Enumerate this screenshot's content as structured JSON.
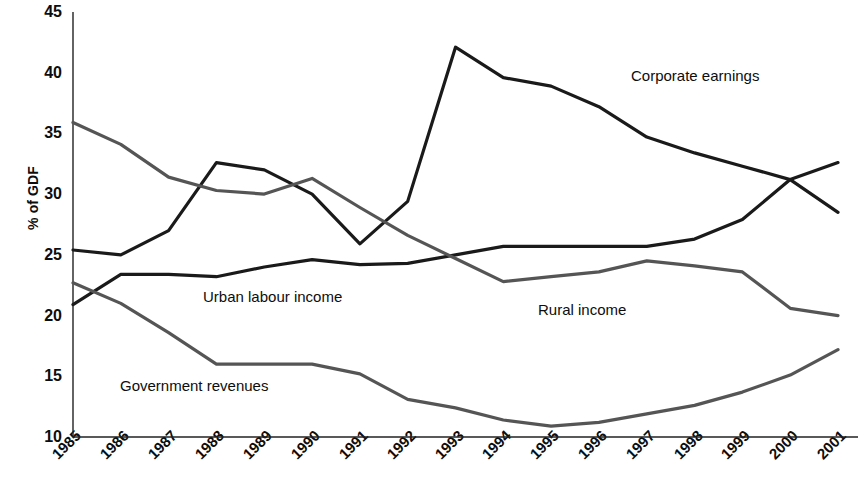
{
  "chart_data": {
    "type": "line",
    "title": "",
    "subtitle": "",
    "xlabel": "",
    "ylabel": "% of GDF",
    "x": [
      1985,
      1986,
      1987,
      1988,
      1989,
      1990,
      1991,
      1992,
      1993,
      1994,
      1995,
      1996,
      1997,
      1998,
      1999,
      2000,
      2001
    ],
    "xtick_labels": [
      "1985",
      "1986",
      "1987",
      "1988",
      "1989",
      "1990",
      "1991",
      "1992",
      "1993",
      "1994",
      "1995",
      "1996",
      "1997",
      "1998",
      "1999",
      "2000",
      "2001"
    ],
    "ytick_labels": [
      "45",
      "40",
      "35",
      "30",
      "25",
      "20",
      "15",
      "10"
    ],
    "yticks": [
      45,
      40,
      35,
      30,
      25,
      20,
      15,
      10
    ],
    "ylim": [
      10,
      45
    ],
    "xlim": [
      1985,
      2001
    ],
    "grid": false,
    "legend_position": "inline-annotations",
    "series": [
      {
        "name": "Corporate earnings",
        "color": "#1a1a1a",
        "label_x": 2000,
        "values": [
          25.4,
          25.0,
          27.0,
          32.6,
          32.0,
          30.0,
          25.9,
          29.4,
          42.1,
          39.6,
          38.9,
          37.2,
          34.7,
          33.4,
          32.3,
          31.2,
          28.5
        ]
      },
      {
        "name": "Urban labour income",
        "color": "#1a1a1a",
        "label_x": 1990,
        "values": [
          20.9,
          23.4,
          23.4,
          23.2,
          24.0,
          24.6,
          24.2,
          24.3,
          25.0,
          25.7,
          25.7,
          25.7,
          25.7,
          26.3,
          27.9,
          31.2,
          32.6
        ]
      },
      {
        "name": "Rural income",
        "color": "#555555",
        "label_x": 1996,
        "values": [
          35.9,
          34.1,
          31.4,
          30.3,
          30.0,
          31.3,
          28.9,
          26.6,
          24.7,
          22.8,
          23.2,
          23.6,
          24.5,
          24.1,
          23.6,
          20.6,
          20.0
        ]
      },
      {
        "name": "Government revenues",
        "color": "#555555",
        "label_x": 1988,
        "values": [
          22.7,
          21.0,
          18.6,
          16.0,
          16.0,
          16.0,
          15.2,
          13.1,
          12.4,
          11.4,
          10.9,
          11.2,
          11.9,
          12.6,
          13.7,
          15.1,
          17.2
        ]
      }
    ],
    "annotations": [
      {
        "text": "Corporate earnings",
        "x_px": 631,
        "y_px": 68
      },
      {
        "text": "Urban labour income",
        "x_px": 203,
        "y_px": 289
      },
      {
        "text": "Rural income",
        "x_px": 538,
        "y_px": 302
      },
      {
        "text": "Government revenues",
        "x_px": 120,
        "y_px": 378
      }
    ],
    "axis_geometry": {
      "plot_left_px": 73,
      "plot_right_px": 838,
      "plot_top_px": 12,
      "plot_bottom_px": 437
    }
  }
}
